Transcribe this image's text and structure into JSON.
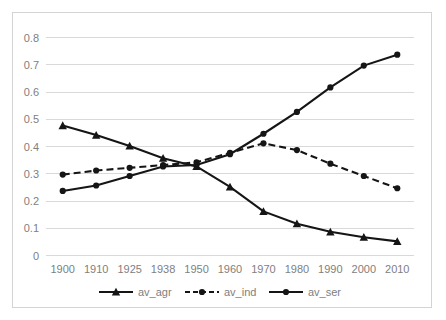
{
  "chart_data": {
    "type": "line",
    "title": "",
    "subtitle": "",
    "xlabel": "",
    "ylabel": "",
    "categories": [
      "1900",
      "1910",
      "1925",
      "1938",
      "1950",
      "1960",
      "1970",
      "1980",
      "1990",
      "2000",
      "2010"
    ],
    "ylim": [
      0,
      0.8
    ],
    "ytick_labels": [
      "0",
      "0.1",
      "0.2",
      "0.3",
      "0.4",
      "0.5",
      "0.6",
      "0.7",
      "0.8"
    ],
    "ytick_values": [
      0,
      0.1,
      0.2,
      0.3,
      0.4,
      0.5,
      0.6,
      0.7,
      0.8
    ],
    "grid": "horizontal",
    "legend_position": "bottom",
    "series": [
      {
        "name": "av_agr",
        "marker": "triangle",
        "linestyle": "solid",
        "color": "#151515",
        "values": [
          0.475,
          0.44,
          0.4,
          0.355,
          0.325,
          0.25,
          0.16,
          0.115,
          0.085,
          0.065,
          0.05
        ]
      },
      {
        "name": "av_ind",
        "marker": "circle",
        "linestyle": "dashed",
        "color": "#151515",
        "values": [
          0.295,
          0.31,
          0.32,
          0.33,
          0.34,
          0.375,
          0.41,
          0.385,
          0.335,
          0.29,
          0.245
        ]
      },
      {
        "name": "av_ser",
        "marker": "circle",
        "linestyle": "solid",
        "color": "#151515",
        "values": [
          0.235,
          0.255,
          0.29,
          0.325,
          0.33,
          0.37,
          0.445,
          0.525,
          0.615,
          0.695,
          0.735
        ]
      }
    ]
  },
  "legend": {
    "entries": [
      {
        "label": "av_agr"
      },
      {
        "label": "av_ind"
      },
      {
        "label": "av_ser"
      }
    ]
  },
  "colors": {
    "grid": "#d9d9d9",
    "tick_text": "#808080",
    "series": "#151515",
    "border": "#d4d4d4",
    "background": "#ffffff"
  }
}
